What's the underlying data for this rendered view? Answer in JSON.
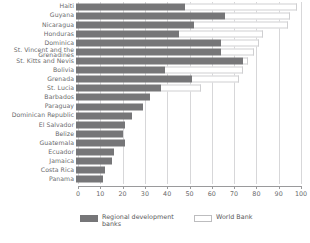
{
  "chart_data": {
    "type": "bar",
    "orientation": "horizontal",
    "stacked": true,
    "title": "",
    "subtitle": "",
    "xlabel": "",
    "ylabel": "",
    "xlim": [
      0,
      100
    ],
    "xticks": [
      0,
      10,
      20,
      30,
      40,
      50,
      60,
      70,
      80,
      90,
      100
    ],
    "xtick_labels": [
      "0",
      "10",
      "20",
      "30",
      "40",
      "50",
      "60",
      "70",
      "80",
      "90",
      "100"
    ],
    "grid": true,
    "legend_position": "bottom",
    "categories": [
      "Haiti",
      "Guyana",
      "Nicaragua",
      "Honduras",
      "Dominica",
      "St. Vincent and the Grenadines",
      "St. Kitts and Nevis",
      "Bolivia",
      "Grenada",
      "St. Lucia",
      "Barbados",
      "Paraguay",
      "Dominican Republic",
      "El Salvador",
      "Belize",
      "Guatemala",
      "Ecuador",
      "Jamaica",
      "Costa Rica",
      "Panama"
    ],
    "series": [
      {
        "name": "Regional development banks",
        "color": "#767678",
        "values": [
          49,
          67,
          53,
          46,
          65,
          65,
          75,
          40,
          52,
          38,
          33,
          30,
          25,
          22,
          21,
          22,
          17,
          16,
          13,
          12
        ]
      },
      {
        "name": "World Bank",
        "color": "#ffffff",
        "values": [
          50,
          29,
          42,
          38,
          17,
          15,
          2,
          35,
          21,
          18,
          0,
          0,
          0,
          0,
          0,
          0,
          0,
          0,
          0,
          0
        ]
      }
    ]
  },
  "legend": {
    "items": [
      {
        "label": "Regional development banks",
        "swatch": "dark-gray-filled"
      },
      {
        "label": "World Bank",
        "swatch": "white-outline"
      }
    ]
  }
}
